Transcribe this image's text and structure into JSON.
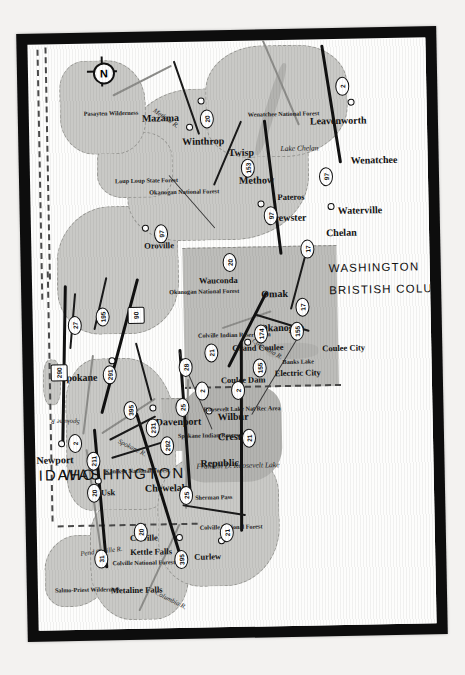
{
  "map": {
    "title": "Northeastern Washington State Road Map",
    "orientation_note": "map artwork rotated 90 degrees (labels read bottom-to-top)",
    "compass": {
      "letter": "N",
      "name": "north-arrow"
    },
    "frame_color": "#0d0d0d",
    "page_color": "#f2f1ef",
    "land_color": "#fdfdfc",
    "forest_color": "#c9c9c6",
    "water_color": "#b3b3b0",
    "reservation_color": "#bdbdba",
    "regions": [
      {
        "label": "IDAHO",
        "kind": "state"
      },
      {
        "label": "WASHINGTON",
        "kind": "state"
      },
      {
        "label": "BRISTISH COLUMBIA",
        "kind": "province"
      },
      {
        "label": "WASHINGTON",
        "kind": "state-secondary"
      }
    ],
    "cities": [
      {
        "label": "Newport"
      },
      {
        "label": "Usk"
      },
      {
        "label": "Spokane"
      },
      {
        "label": "Metaline Falls"
      },
      {
        "label": "Kettle Falls"
      },
      {
        "label": "Colville"
      },
      {
        "label": "Chewelah"
      },
      {
        "label": "Davenport"
      },
      {
        "label": "Curlew"
      },
      {
        "label": "Republic"
      },
      {
        "label": "Wauconda"
      },
      {
        "label": "Creston"
      },
      {
        "label": "Wilbur"
      },
      {
        "label": "Coulee Dam"
      },
      {
        "label": "Grand Coulee"
      },
      {
        "label": "Electric City"
      },
      {
        "label": "Coulee City"
      },
      {
        "label": "Okanogan"
      },
      {
        "label": "Oroville"
      },
      {
        "label": "Omak"
      },
      {
        "label": "Brewster"
      },
      {
        "label": "Pateros"
      },
      {
        "label": "Chelan"
      },
      {
        "label": "Waterville"
      },
      {
        "label": "Wenatchee"
      },
      {
        "label": "Mazama"
      },
      {
        "label": "Winthrop"
      },
      {
        "label": "Twisp"
      },
      {
        "label": "Methow"
      },
      {
        "label": "Leavenworth"
      }
    ],
    "features": [
      {
        "label": "Salmo-Priest Wilderness",
        "kind": "wilderness"
      },
      {
        "label": "Colville National Forest",
        "kind": "forest"
      },
      {
        "label": "Kaniksu National Forest",
        "kind": "forest"
      },
      {
        "label": "Colville National Forest",
        "kind": "forest"
      },
      {
        "label": "Okanogan National Forest",
        "kind": "forest"
      },
      {
        "label": "Okanogan National Forest",
        "kind": "forest"
      },
      {
        "label": "Wenatchee National Forest",
        "kind": "forest"
      },
      {
        "label": "Loup Loup State Forest",
        "kind": "forest"
      },
      {
        "label": "Pasayten Wilderness",
        "kind": "wilderness"
      },
      {
        "label": "Spokane Indian Reservation",
        "kind": "reservation"
      },
      {
        "label": "Colville Indian Reservation",
        "kind": "reservation"
      },
      {
        "label": "Roosevelt Lake Nat Rec Area",
        "kind": "rec-area"
      },
      {
        "label": "Sherman Pass",
        "kind": "pass"
      }
    ],
    "water": [
      {
        "label": "Pend Oreille R.",
        "kind": "river"
      },
      {
        "label": "Columbia R.",
        "kind": "river"
      },
      {
        "label": "Spokane R.",
        "kind": "river"
      },
      {
        "label": "Spokane R.",
        "kind": "river"
      },
      {
        "label": "Columbia R.",
        "kind": "river"
      },
      {
        "label": "Methow R.",
        "kind": "river"
      },
      {
        "label": "Franklin D. Roosevelt Lake",
        "kind": "lake"
      },
      {
        "label": "Banks Lake",
        "kind": "lake"
      },
      {
        "label": "Lake Chelan",
        "kind": "lake"
      }
    ],
    "routes": [
      {
        "number": "31"
      },
      {
        "number": "20"
      },
      {
        "number": "20"
      },
      {
        "number": "211"
      },
      {
        "number": "2"
      },
      {
        "number": "290"
      },
      {
        "number": "27"
      },
      {
        "number": "195"
      },
      {
        "number": "291"
      },
      {
        "number": "90"
      },
      {
        "number": "395"
      },
      {
        "number": "231"
      },
      {
        "number": "292"
      },
      {
        "number": "25"
      },
      {
        "number": "25"
      },
      {
        "number": "28"
      },
      {
        "number": "2"
      },
      {
        "number": "395"
      },
      {
        "number": "21"
      },
      {
        "number": "21"
      },
      {
        "number": "21"
      },
      {
        "number": "2"
      },
      {
        "number": "20"
      },
      {
        "number": "97"
      },
      {
        "number": "155"
      },
      {
        "number": "155"
      },
      {
        "number": "174"
      },
      {
        "number": "17"
      },
      {
        "number": "17"
      },
      {
        "number": "97"
      },
      {
        "number": "153"
      },
      {
        "number": "20"
      },
      {
        "number": "97"
      },
      {
        "number": "2"
      }
    ]
  }
}
